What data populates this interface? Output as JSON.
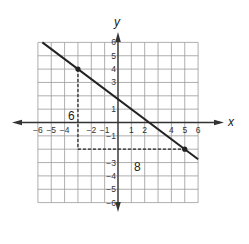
{
  "graph": {
    "x_axis_label": "x",
    "y_axis_label": "y",
    "x_range": [
      -6,
      6
    ],
    "y_range": [
      -6,
      6
    ],
    "x_tick_labels": [
      {
        "value": -6,
        "label": "−6"
      },
      {
        "value": -5,
        "label": "−5"
      },
      {
        "value": -4,
        "label": "−4"
      },
      {
        "value": -2,
        "label": "−2"
      },
      {
        "value": -1,
        "label": "−1"
      },
      {
        "value": 1,
        "label": "1"
      },
      {
        "value": 2,
        "label": "2"
      },
      {
        "value": 4,
        "label": "4"
      },
      {
        "value": 5,
        "label": "5"
      },
      {
        "value": 6,
        "label": "6"
      }
    ],
    "y_tick_labels": [
      {
        "value": 6,
        "label": "6"
      },
      {
        "value": 5,
        "label": "5"
      },
      {
        "value": 4,
        "label": "4"
      },
      {
        "value": 3,
        "label": "3"
      },
      {
        "value": 1,
        "label": "1"
      },
      {
        "value": -1,
        "label": "−1"
      },
      {
        "value": -3,
        "label": "−3"
      },
      {
        "value": -4,
        "label": "−4"
      },
      {
        "value": -5,
        "label": "−5"
      },
      {
        "value": -6,
        "label": "−6"
      }
    ],
    "line": {
      "points": [
        [
          -3,
          4
        ],
        [
          5,
          -2
        ]
      ],
      "slope": "-3/4",
      "color": "#222222"
    },
    "rise_label": "6",
    "run_label": "8",
    "grid_color": "#9a9a9a"
  }
}
